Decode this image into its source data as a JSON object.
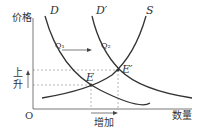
{
  "diagram": {
    "title": "",
    "y_axis_label": "价格",
    "x_axis_label": "数量",
    "origin_label": "O",
    "curves": [
      {
        "name": "D",
        "label": "D"
      },
      {
        "name": "D_prime",
        "label": "D′"
      },
      {
        "name": "S",
        "label": "S"
      }
    ],
    "points": [
      {
        "name": "E",
        "label": "E"
      },
      {
        "name": "E_prime",
        "label": "E′"
      },
      {
        "name": "Q1",
        "label": "Q₁"
      },
      {
        "name": "Q2",
        "label": "Q₂"
      }
    ],
    "price_change_label_top": "上",
    "price_change_label_bottom": "升",
    "quantity_change_label": "增加",
    "colors": {
      "curve": "#333333",
      "dashed": "#777777",
      "text": "#333333"
    }
  }
}
